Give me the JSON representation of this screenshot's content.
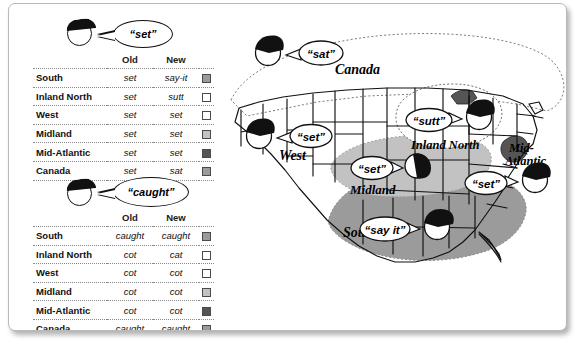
{
  "panel_set": {
    "speaker_word": "“set”",
    "speaker_icon": "head-icon",
    "headers": {
      "region": "",
      "old": "Old",
      "new": "New"
    },
    "rows": [
      {
        "region": "South",
        "old": "set",
        "new": "say-it",
        "swatch": "#9b9b9b"
      },
      {
        "region": "Inland North",
        "old": "set",
        "new": "sutt",
        "swatch": "#ffffff"
      },
      {
        "region": "West",
        "old": "set",
        "new": "set",
        "swatch": "#ffffff"
      },
      {
        "region": "Midland",
        "old": "set",
        "new": "set",
        "swatch": "#c2c2c2"
      },
      {
        "region": "Mid-Atlantic",
        "old": "set",
        "new": "set",
        "swatch": "#555555"
      },
      {
        "region": "Canada",
        "old": "set",
        "new": "sat",
        "swatch": "#9b9b9b"
      }
    ]
  },
  "panel_caught": {
    "speaker_word": "“caught”",
    "speaker_icon": "head-icon",
    "headers": {
      "region": "",
      "old": "Old",
      "new": "New"
    },
    "rows": [
      {
        "region": "South",
        "old": "caught",
        "new": "caught",
        "swatch": "#9b9b9b"
      },
      {
        "region": "Inland North",
        "old": "cot",
        "new": "cat",
        "swatch": "#ffffff"
      },
      {
        "region": "West",
        "old": "cot",
        "new": "cot",
        "swatch": "#ffffff"
      },
      {
        "region": "Midland",
        "old": "cot",
        "new": "cot",
        "swatch": "#c2c2c2"
      },
      {
        "region": "Mid-Atlantic",
        "old": "cot",
        "new": "cot",
        "swatch": "#555555"
      },
      {
        "region": "Canada",
        "old": "caught",
        "new": "caught",
        "swatch": "#9b9b9b"
      }
    ]
  },
  "map": {
    "region_labels": [
      {
        "id": "canada",
        "text": "Canada"
      },
      {
        "id": "west",
        "text": "West"
      },
      {
        "id": "midland",
        "text": "Midland"
      },
      {
        "id": "south",
        "text": "South"
      },
      {
        "id": "inland-north",
        "text": "Inland North"
      },
      {
        "id": "mid-atlantic-1",
        "text": "Mid-"
      },
      {
        "id": "mid-atlantic-2",
        "text": "Atlantic"
      }
    ],
    "callouts": [
      {
        "id": "canada-callout",
        "text": "“sat”"
      },
      {
        "id": "west-callout",
        "text": "“set”"
      },
      {
        "id": "inland-north-callout",
        "text": "“sutt”"
      },
      {
        "id": "midland-callout",
        "text": "“set”"
      },
      {
        "id": "mid-atlantic-callout",
        "text": "“set”"
      },
      {
        "id": "south-callout",
        "text": "“say it”"
      }
    ],
    "colors": {
      "south_fill": "#9b9b9b",
      "midland_fill": "#c2c2c2",
      "inland_north_fill": "#ffffff",
      "mid_atlantic_fill": "#555555",
      "west_fill": "#ffffff",
      "canada_fill": "#ffffff",
      "outline": "#111111"
    }
  }
}
